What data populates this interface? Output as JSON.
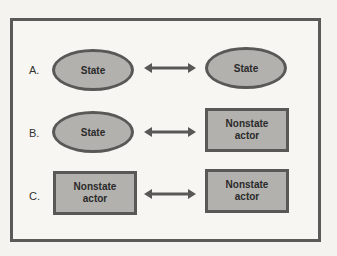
{
  "rows": [
    {
      "label": "A.",
      "left": {
        "shape": "ellipse",
        "text": "State"
      },
      "right": {
        "shape": "ellipse",
        "text": "State"
      }
    },
    {
      "label": "B.",
      "left": {
        "shape": "ellipse",
        "text": "State"
      },
      "right": {
        "shape": "rectangle",
        "text": "Nonstate\nactor"
      }
    },
    {
      "label": "C.",
      "left": {
        "shape": "rectangle",
        "text": "Nonstate\nactor"
      },
      "right": {
        "shape": "rectangle",
        "text": "Nonstate\nactor"
      }
    }
  ],
  "colors": {
    "fill": "#b3b1ae",
    "stroke": "#5a5856",
    "frame": "#5c5a58"
  }
}
